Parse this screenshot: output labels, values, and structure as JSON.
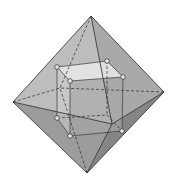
{
  "figure": {
    "colors": {
      "background": "#ffffff",
      "face_left_upper": "#bdbdbd",
      "face_right_upper": "#a9a9a9",
      "face_left_lower": "#9c9c9c",
      "face_right_lower": "#8a8a8a",
      "face_front_dark": "#7a7a7a",
      "cube_top": "#e6e6e6",
      "cube_front": "#a4a4a4",
      "cube_left": "#c2c2c2",
      "edge": "#2b2b2b",
      "vertex_fill": "#e8e8e8"
    },
    "octahedron": {
      "top": [
        91,
        16
      ],
      "left": [
        13,
        102
      ],
      "right": [
        164,
        92
      ],
      "bottom": [
        87,
        173
      ],
      "front": [
        112,
        124
      ],
      "back": [
        60,
        88
      ]
    },
    "cube": {
      "tbl": [
        57,
        67
      ],
      "tbr": [
        107,
        61
      ],
      "tfl": [
        70,
        81
      ],
      "tfr": [
        123,
        77
      ],
      "bbl": [
        57,
        118
      ],
      "bbr": [
        107,
        115
      ],
      "bfl": [
        70,
        136
      ],
      "bfr": [
        122,
        131
      ]
    }
  }
}
